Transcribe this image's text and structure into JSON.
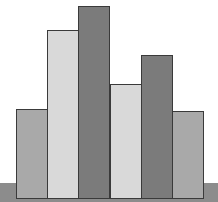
{
  "chart_data": {
    "type": "bar",
    "title": "",
    "xlabel": "",
    "ylabel": "",
    "categories": [
      "1",
      "2",
      "3",
      "4",
      "5",
      "6"
    ],
    "values": [
      90,
      169,
      193,
      115,
      144,
      88
    ],
    "colors": [
      "#a9a9a9",
      "#d9d9d9",
      "#7b7b7b",
      "#d9d9d9",
      "#7b7b7b",
      "#a9a9a9"
    ],
    "ylim": [
      0,
      200
    ],
    "grid": false,
    "legend": null,
    "axis_labels_visible": false
  },
  "layout": {
    "baseline_y": 199,
    "bar_left": [
      16,
      47,
      78,
      110,
      141,
      172
    ],
    "bar_width": 31,
    "base_color": "#8c8c8c"
  }
}
